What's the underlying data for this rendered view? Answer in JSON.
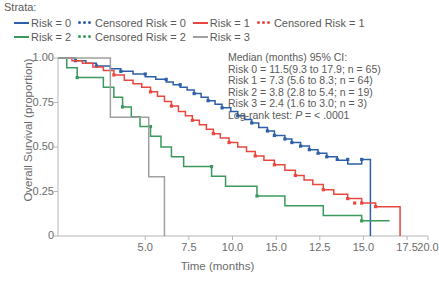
{
  "legend": {
    "title": "Strata:",
    "rows": [
      [
        {
          "style": "solid",
          "color": "#2d5fa8",
          "label": "Risk = 0",
          "name": "legend-risk-0"
        },
        {
          "style": "dots",
          "color": "#2d5fa8",
          "label": "Censored Risk = 0",
          "name": "legend-censored-risk-0"
        },
        {
          "style": "solid",
          "color": "#e8473f",
          "label": "Risk = 1",
          "name": "legend-risk-1"
        },
        {
          "style": "dots",
          "color": "#e8473f",
          "label": "Censored Risk = 1",
          "name": "legend-censored-risk-1"
        }
      ],
      [
        {
          "style": "solid",
          "color": "#3a9a5c",
          "label": "Risk = 2",
          "name": "legend-risk-2"
        },
        {
          "style": "dots",
          "color": "#3a9a5c",
          "label": "Censored Risk = 2",
          "name": "legend-censored-risk-2"
        },
        {
          "style": "solid",
          "color": "#a0a0a0",
          "label": "Risk = 3",
          "name": "legend-risk-3"
        }
      ]
    ]
  },
  "annotation": {
    "heading": "Median (months) 95% CI:",
    "lines": [
      "Risk 0 = 11.5(9.3 to 17.9; n = 65)",
      "Risk 1 = 7.3 (5.6 to 8.3; n = 64)",
      "Risk 2 = 3.8 (2.8 to 5.4; n = 19)",
      "Risk 3 = 2.4 (1.6 to 3.0; n = 3)"
    ],
    "logrank_prefix": "Log-rank test: ",
    "logrank_italic": "P",
    "logrank_suffix": " = < .0001"
  },
  "chart_data": {
    "type": "line",
    "title": "",
    "xlabel": "Time (months)",
    "ylabel": "Overall Survival (proportion)",
    "xlim": [
      0,
      21.2
    ],
    "ylim": [
      0,
      1.0
    ],
    "grid": false,
    "legend_position": "top",
    "y_ticks": [
      {
        "value": 1.0,
        "label": "1.00"
      },
      {
        "value": 0.75,
        "label": "0.75"
      },
      {
        "value": 0.5,
        "label": "0.50"
      },
      {
        "value": 0.25,
        "label": "0.25"
      },
      {
        "value": 0.0,
        "label": "0"
      }
    ],
    "x_ticks": [
      {
        "value": 5.0,
        "label": "5.0"
      },
      {
        "value": 7.5,
        "label": "7.5"
      },
      {
        "value": 10.0,
        "label": "10.0"
      },
      {
        "value": 12.5,
        "label": "15.0"
      },
      {
        "value": 15.0,
        "label": "12.5"
      },
      {
        "value": 17.5,
        "label": "15.0"
      },
      {
        "value": 20.0,
        "label": "17.5"
      },
      {
        "value": 21.2,
        "label": "20.0"
      }
    ],
    "series": [
      {
        "name": "Risk = 0",
        "color": "#2d5fa8",
        "median": 11.5,
        "ci": [
          9.3,
          17.9
        ],
        "n": 65,
        "points": [
          [
            0,
            1.0
          ],
          [
            1.0,
            1.0
          ],
          [
            1.0,
            0.985
          ],
          [
            1.6,
            0.985
          ],
          [
            1.6,
            0.97
          ],
          [
            2.2,
            0.97
          ],
          [
            2.2,
            0.955
          ],
          [
            3.0,
            0.955
          ],
          [
            3.0,
            0.94
          ],
          [
            3.6,
            0.94
          ],
          [
            3.6,
            0.925
          ],
          [
            4.3,
            0.925
          ],
          [
            4.3,
            0.91
          ],
          [
            5.0,
            0.91
          ],
          [
            5.0,
            0.895
          ],
          [
            5.6,
            0.895
          ],
          [
            5.6,
            0.88
          ],
          [
            6.2,
            0.88
          ],
          [
            6.2,
            0.865
          ],
          [
            6.6,
            0.865
          ],
          [
            6.6,
            0.85
          ],
          [
            7.0,
            0.85
          ],
          [
            7.0,
            0.835
          ],
          [
            7.4,
            0.835
          ],
          [
            7.4,
            0.82
          ],
          [
            7.8,
            0.82
          ],
          [
            7.8,
            0.8
          ],
          [
            8.2,
            0.8
          ],
          [
            8.2,
            0.78
          ],
          [
            8.6,
            0.78
          ],
          [
            8.6,
            0.76
          ],
          [
            9.0,
            0.76
          ],
          [
            9.0,
            0.74
          ],
          [
            9.4,
            0.74
          ],
          [
            9.4,
            0.72
          ],
          [
            9.9,
            0.72
          ],
          [
            9.9,
            0.7
          ],
          [
            10.3,
            0.7
          ],
          [
            10.3,
            0.675
          ],
          [
            10.7,
            0.675
          ],
          [
            10.7,
            0.655
          ],
          [
            11.1,
            0.655
          ],
          [
            11.1,
            0.635
          ],
          [
            11.5,
            0.635
          ],
          [
            11.5,
            0.61
          ],
          [
            12.0,
            0.61
          ],
          [
            12.0,
            0.59
          ],
          [
            12.4,
            0.59
          ],
          [
            12.4,
            0.565
          ],
          [
            13.0,
            0.565
          ],
          [
            13.0,
            0.545
          ],
          [
            13.4,
            0.545
          ],
          [
            13.4,
            0.525
          ],
          [
            13.9,
            0.525
          ],
          [
            13.9,
            0.505
          ],
          [
            14.4,
            0.505
          ],
          [
            14.4,
            0.485
          ],
          [
            14.9,
            0.485
          ],
          [
            14.9,
            0.465
          ],
          [
            15.4,
            0.465
          ],
          [
            15.4,
            0.445
          ],
          [
            16.0,
            0.445
          ],
          [
            16.0,
            0.425
          ],
          [
            16.6,
            0.425
          ],
          [
            16.6,
            0.405
          ],
          [
            17.4,
            0.405
          ],
          [
            17.4,
            0.43
          ],
          [
            17.4,
            0.43
          ],
          [
            17.9,
            0.43
          ],
          [
            17.9,
            0.0
          ]
        ],
        "censored": [
          [
            1.0,
            0.985
          ],
          [
            2.2,
            0.955
          ],
          [
            3.6,
            0.925
          ],
          [
            5.0,
            0.91
          ],
          [
            6.2,
            0.88
          ],
          [
            7.0,
            0.85
          ],
          [
            7.8,
            0.8
          ],
          [
            8.6,
            0.76
          ],
          [
            9.4,
            0.72
          ],
          [
            10.3,
            0.675
          ],
          [
            11.1,
            0.635
          ],
          [
            12.0,
            0.59
          ],
          [
            12.4,
            0.565
          ],
          [
            13.0,
            0.545
          ],
          [
            13.4,
            0.525
          ],
          [
            13.9,
            0.505
          ],
          [
            14.4,
            0.485
          ],
          [
            14.9,
            0.465
          ],
          [
            15.4,
            0.445
          ],
          [
            16.0,
            0.43
          ],
          [
            16.6,
            0.43
          ],
          [
            17.4,
            0.43
          ]
        ]
      },
      {
        "name": "Risk = 1",
        "color": "#e8473f",
        "median": 7.3,
        "ci": [
          5.6,
          8.3
        ],
        "n": 64,
        "points": [
          [
            0,
            1.0
          ],
          [
            0.8,
            1.0
          ],
          [
            0.8,
            0.985
          ],
          [
            1.4,
            0.985
          ],
          [
            1.4,
            0.97
          ],
          [
            2.0,
            0.97
          ],
          [
            2.0,
            0.95
          ],
          [
            2.6,
            0.95
          ],
          [
            2.6,
            0.93
          ],
          [
            3.2,
            0.93
          ],
          [
            3.2,
            0.905
          ],
          [
            3.8,
            0.905
          ],
          [
            3.8,
            0.875
          ],
          [
            4.3,
            0.875
          ],
          [
            4.3,
            0.855
          ],
          [
            4.8,
            0.855
          ],
          [
            4.8,
            0.835
          ],
          [
            5.3,
            0.835
          ],
          [
            5.3,
            0.81
          ],
          [
            5.7,
            0.81
          ],
          [
            5.7,
            0.785
          ],
          [
            6.1,
            0.785
          ],
          [
            6.1,
            0.755
          ],
          [
            6.5,
            0.755
          ],
          [
            6.5,
            0.73
          ],
          [
            6.9,
            0.73
          ],
          [
            6.9,
            0.7
          ],
          [
            7.3,
            0.7
          ],
          [
            7.3,
            0.675
          ],
          [
            7.7,
            0.675
          ],
          [
            7.7,
            0.65
          ],
          [
            8.1,
            0.65
          ],
          [
            8.1,
            0.625
          ],
          [
            8.5,
            0.625
          ],
          [
            8.5,
            0.6
          ],
          [
            8.9,
            0.6
          ],
          [
            8.9,
            0.575
          ],
          [
            9.3,
            0.575
          ],
          [
            9.3,
            0.55
          ],
          [
            9.8,
            0.55
          ],
          [
            9.8,
            0.525
          ],
          [
            10.3,
            0.525
          ],
          [
            10.3,
            0.5
          ],
          [
            10.8,
            0.5
          ],
          [
            10.8,
            0.475
          ],
          [
            11.3,
            0.475
          ],
          [
            11.3,
            0.45
          ],
          [
            11.8,
            0.45
          ],
          [
            11.8,
            0.425
          ],
          [
            12.4,
            0.425
          ],
          [
            12.4,
            0.4
          ],
          [
            13.0,
            0.4
          ],
          [
            13.0,
            0.37
          ],
          [
            13.6,
            0.37
          ],
          [
            13.6,
            0.34
          ],
          [
            14.1,
            0.34
          ],
          [
            14.1,
            0.315
          ],
          [
            14.6,
            0.315
          ],
          [
            14.6,
            0.29
          ],
          [
            15.2,
            0.29
          ],
          [
            15.2,
            0.26
          ],
          [
            15.8,
            0.26
          ],
          [
            15.8,
            0.235
          ],
          [
            16.6,
            0.235
          ],
          [
            16.6,
            0.21
          ],
          [
            17.4,
            0.21
          ],
          [
            17.4,
            0.185
          ],
          [
            18.2,
            0.185
          ],
          [
            18.2,
            0.165
          ],
          [
            19.6,
            0.165
          ],
          [
            19.6,
            0.0
          ]
        ],
        "censored": [
          [
            3.2,
            0.905
          ],
          [
            5.3,
            0.81
          ],
          [
            6.5,
            0.73
          ],
          [
            7.7,
            0.65
          ],
          [
            8.9,
            0.575
          ],
          [
            9.8,
            0.525
          ],
          [
            11.3,
            0.45
          ],
          [
            12.4,
            0.4
          ],
          [
            13.6,
            0.34
          ],
          [
            15.2,
            0.26
          ],
          [
            16.6,
            0.21
          ],
          [
            17.0,
            0.185
          ],
          [
            17.4,
            0.185
          ],
          [
            18.2,
            0.165
          ]
        ]
      },
      {
        "name": "Risk = 2",
        "color": "#3a9a5c",
        "median": 3.8,
        "ci": [
          2.8,
          5.4
        ],
        "n": 19,
        "points": [
          [
            0,
            1.0
          ],
          [
            0.5,
            1.0
          ],
          [
            0.5,
            0.945
          ],
          [
            1.1,
            0.945
          ],
          [
            1.1,
            0.89
          ],
          [
            2.6,
            0.89
          ],
          [
            2.6,
            0.835
          ],
          [
            3.2,
            0.835
          ],
          [
            3.2,
            0.78
          ],
          [
            3.7,
            0.78
          ],
          [
            3.7,
            0.725
          ],
          [
            4.2,
            0.725
          ],
          [
            4.2,
            0.67
          ],
          [
            4.7,
            0.67
          ],
          [
            4.7,
            0.615
          ],
          [
            5.3,
            0.615
          ],
          [
            5.3,
            0.56
          ],
          [
            5.9,
            0.56
          ],
          [
            5.9,
            0.5
          ],
          [
            6.5,
            0.5
          ],
          [
            6.5,
            0.445
          ],
          [
            7.2,
            0.445
          ],
          [
            7.2,
            0.39
          ],
          [
            8.8,
            0.39
          ],
          [
            8.8,
            0.335
          ],
          [
            9.6,
            0.335
          ],
          [
            9.6,
            0.28
          ],
          [
            11.4,
            0.28
          ],
          [
            11.4,
            0.225
          ],
          [
            13.0,
            0.225
          ],
          [
            13.0,
            0.17
          ],
          [
            15.2,
            0.17
          ],
          [
            15.2,
            0.115
          ],
          [
            17.4,
            0.115
          ],
          [
            17.4,
            0.085
          ],
          [
            19.0,
            0.085
          ]
        ],
        "censored": [
          [
            1.1,
            0.89
          ],
          [
            3.7,
            0.725
          ],
          [
            5.3,
            0.615
          ],
          [
            8.8,
            0.39
          ],
          [
            11.4,
            0.225
          ],
          [
            17.4,
            0.085
          ]
        ]
      },
      {
        "name": "Risk = 3",
        "color": "#a0a0a0",
        "median": 2.4,
        "ci": [
          1.6,
          3.0
        ],
        "n": 3,
        "points": [
          [
            0,
            1.0
          ],
          [
            3.0,
            1.0
          ],
          [
            3.0,
            0.667
          ],
          [
            5.2,
            0.667
          ],
          [
            5.2,
            0.333
          ],
          [
            6.1,
            0.333
          ],
          [
            6.1,
            0.0
          ]
        ],
        "censored": []
      }
    ]
  }
}
